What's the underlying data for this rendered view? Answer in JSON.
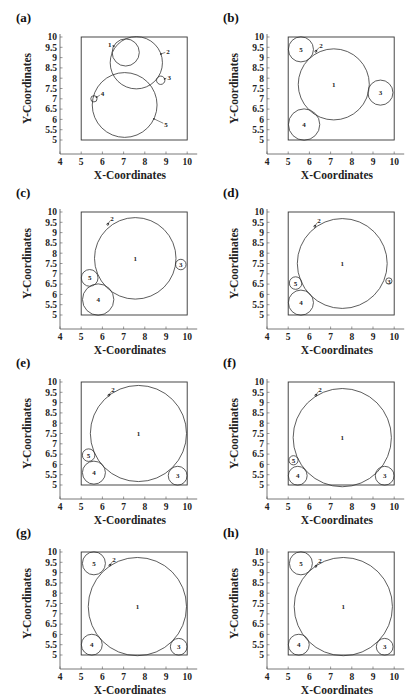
{
  "figure": {
    "xlabel": "X-Coordinates",
    "ylabel": "Y-Coordinates",
    "x_ticks": [
      "4",
      "5",
      "6",
      "7",
      "8",
      "9",
      "10"
    ],
    "y_ticks": [
      "5",
      "5.5",
      "6",
      "6.5",
      "7",
      "7.5",
      "8",
      "8.5",
      "9",
      "9.5",
      "10"
    ]
  },
  "chart_data": [
    {
      "panel": "(a)",
      "type": "scatter",
      "title": "",
      "xlabel": "X-Coordinates",
      "ylabel": "Y-Coordinates",
      "xlim": [
        4,
        10
      ],
      "ylim": [
        5,
        10
      ],
      "container": {
        "x": [
          5,
          10
        ],
        "y": [
          5,
          10
        ]
      },
      "circles": [
        {
          "id": "1",
          "cx": 7.1,
          "cy": 9.25,
          "r": 0.65,
          "label_style": "arrow",
          "lx": 6.35,
          "ly": 9.65
        },
        {
          "id": "2",
          "cx": 7.6,
          "cy": 8.75,
          "r": 1.25,
          "label_style": "arrow",
          "lx": 9.1,
          "ly": 9.3
        },
        {
          "id": "3",
          "cx": 8.75,
          "cy": 7.9,
          "r": 0.2,
          "label_style": "arrow",
          "lx": 9.15,
          "ly": 8.05
        },
        {
          "id": "4",
          "cx": 5.6,
          "cy": 7.0,
          "r": 0.15,
          "label_style": "arrow",
          "lx": 6.0,
          "ly": 7.25
        },
        {
          "id": "5",
          "cx": 7.05,
          "cy": 6.7,
          "r": 1.55,
          "label_style": "arrow",
          "lx": 9.0,
          "ly": 5.75
        }
      ]
    },
    {
      "panel": "(b)",
      "type": "scatter",
      "title": "",
      "xlabel": "X-Coordinates",
      "ylabel": "Y-Coordinates",
      "xlim": [
        4,
        10
      ],
      "ylim": [
        5,
        10
      ],
      "container": {
        "x": [
          5,
          10
        ],
        "y": [
          5,
          10
        ]
      },
      "circles": [
        {
          "id": "1",
          "cx": 7.15,
          "cy": 7.7,
          "r": 1.7,
          "label_style": "center"
        },
        {
          "id": "2",
          "cx": 6.3,
          "cy": 9.3,
          "r": 0.04,
          "label_style": "arrow",
          "lx": 6.55,
          "ly": 9.6
        },
        {
          "id": "3",
          "cx": 9.35,
          "cy": 7.3,
          "r": 0.6,
          "label_style": "center"
        },
        {
          "id": "4",
          "cx": 5.75,
          "cy": 5.75,
          "r": 0.75,
          "label_style": "center"
        },
        {
          "id": "5",
          "cx": 5.6,
          "cy": 9.4,
          "r": 0.6,
          "label_style": "center"
        }
      ]
    },
    {
      "panel": "(c)",
      "type": "scatter",
      "title": "",
      "xlabel": "X-Coordinates",
      "ylabel": "Y-Coordinates",
      "xlim": [
        4,
        10
      ],
      "ylim": [
        5,
        10
      ],
      "container": {
        "x": [
          5,
          10
        ],
        "y": [
          5,
          10
        ]
      },
      "circles": [
        {
          "id": "1",
          "cx": 7.55,
          "cy": 7.75,
          "r": 1.95,
          "label_style": "center"
        },
        {
          "id": "2",
          "cx": 6.25,
          "cy": 9.4,
          "r": 0.04,
          "label_style": "arrow",
          "lx": 6.45,
          "ly": 9.7
        },
        {
          "id": "3",
          "cx": 9.7,
          "cy": 7.45,
          "r": 0.25,
          "label_style": "center"
        },
        {
          "id": "4",
          "cx": 5.8,
          "cy": 5.75,
          "r": 0.75,
          "label_style": "center"
        },
        {
          "id": "5",
          "cx": 5.4,
          "cy": 6.8,
          "r": 0.4,
          "label_style": "center"
        }
      ]
    },
    {
      "panel": "(d)",
      "type": "scatter",
      "title": "",
      "xlabel": "X-Coordinates",
      "ylabel": "Y-Coordinates",
      "xlim": [
        4,
        10
      ],
      "ylim": [
        5,
        10
      ],
      "container": {
        "x": [
          5,
          10
        ],
        "y": [
          5,
          10
        ]
      },
      "circles": [
        {
          "id": "1",
          "cx": 7.55,
          "cy": 7.5,
          "r": 2.15,
          "label_style": "center"
        },
        {
          "id": "2",
          "cx": 6.25,
          "cy": 9.3,
          "r": 0.04,
          "label_style": "arrow",
          "lx": 6.45,
          "ly": 9.6
        },
        {
          "id": "3",
          "cx": 9.75,
          "cy": 6.65,
          "r": 0.15,
          "label_style": "center"
        },
        {
          "id": "4",
          "cx": 5.6,
          "cy": 5.6,
          "r": 0.6,
          "label_style": "center"
        },
        {
          "id": "5",
          "cx": 5.35,
          "cy": 6.55,
          "r": 0.3,
          "label_style": "center"
        }
      ]
    },
    {
      "panel": "(e)",
      "type": "scatter",
      "title": "",
      "xlabel": "X-Coordinates",
      "ylabel": "Y-Coordinates",
      "xlim": [
        4,
        10
      ],
      "ylim": [
        5,
        10
      ],
      "container": {
        "x": [
          5,
          10
        ],
        "y": [
          5,
          10
        ]
      },
      "circles": [
        {
          "id": "1",
          "cx": 7.7,
          "cy": 7.5,
          "r": 2.3,
          "label_style": "center"
        },
        {
          "id": "2",
          "cx": 6.3,
          "cy": 9.35,
          "r": 0.04,
          "label_style": "arrow",
          "lx": 6.5,
          "ly": 9.65
        },
        {
          "id": "3",
          "cx": 9.55,
          "cy": 5.45,
          "r": 0.45,
          "label_style": "center"
        },
        {
          "id": "4",
          "cx": 5.6,
          "cy": 5.6,
          "r": 0.55,
          "label_style": "center"
        },
        {
          "id": "5",
          "cx": 5.35,
          "cy": 6.45,
          "r": 0.3,
          "label_style": "center"
        }
      ]
    },
    {
      "panel": "(f)",
      "type": "scatter",
      "title": "",
      "xlabel": "X-Coordinates",
      "ylabel": "Y-Coordinates",
      "xlim": [
        4,
        10
      ],
      "ylim": [
        5,
        10
      ],
      "container": {
        "x": [
          5,
          10
        ],
        "y": [
          5,
          10
        ]
      },
      "circles": [
        {
          "id": "1",
          "cx": 7.55,
          "cy": 7.3,
          "r": 2.35,
          "label_style": "center"
        },
        {
          "id": "2",
          "cx": 6.3,
          "cy": 9.35,
          "r": 0.04,
          "label_style": "arrow",
          "lx": 6.5,
          "ly": 9.65
        },
        {
          "id": "3",
          "cx": 9.55,
          "cy": 5.45,
          "r": 0.45,
          "label_style": "center"
        },
        {
          "id": "4",
          "cx": 5.45,
          "cy": 5.45,
          "r": 0.45,
          "label_style": "center"
        },
        {
          "id": "5",
          "cx": 5.25,
          "cy": 6.2,
          "r": 0.22,
          "label_style": "center"
        }
      ]
    },
    {
      "panel": "(g)",
      "type": "scatter",
      "title": "",
      "xlabel": "X-Coordinates",
      "ylabel": "Y-Coordinates",
      "xlim": [
        4,
        10
      ],
      "ylim": [
        5,
        10
      ],
      "container": {
        "x": [
          5,
          10
        ],
        "y": [
          5,
          10
        ]
      },
      "circles": [
        {
          "id": "1",
          "cx": 7.65,
          "cy": 7.35,
          "r": 2.35,
          "label_style": "center"
        },
        {
          "id": "2",
          "cx": 6.35,
          "cy": 9.35,
          "r": 0.04,
          "label_style": "arrow",
          "lx": 6.55,
          "ly": 9.65
        },
        {
          "id": "3",
          "cx": 9.6,
          "cy": 5.4,
          "r": 0.4,
          "label_style": "center"
        },
        {
          "id": "4",
          "cx": 5.5,
          "cy": 5.5,
          "r": 0.5,
          "label_style": "center"
        },
        {
          "id": "5",
          "cx": 5.6,
          "cy": 9.45,
          "r": 0.55,
          "label_style": "center"
        }
      ]
    },
    {
      "panel": "(h)",
      "type": "scatter",
      "title": "",
      "xlabel": "X-Coordinates",
      "ylabel": "Y-Coordinates",
      "xlim": [
        4,
        10
      ],
      "ylim": [
        5,
        10
      ],
      "container": {
        "x": [
          5,
          10
        ],
        "y": [
          5,
          10
        ]
      },
      "circles": [
        {
          "id": "1",
          "cx": 7.6,
          "cy": 7.35,
          "r": 2.35,
          "label_style": "center"
        },
        {
          "id": "2",
          "cx": 6.3,
          "cy": 9.3,
          "r": 0.04,
          "label_style": "arrow",
          "lx": 6.5,
          "ly": 9.6
        },
        {
          "id": "3",
          "cx": 9.55,
          "cy": 5.4,
          "r": 0.4,
          "label_style": "center"
        },
        {
          "id": "4",
          "cx": 5.5,
          "cy": 5.5,
          "r": 0.5,
          "label_style": "center"
        },
        {
          "id": "5",
          "cx": 5.6,
          "cy": 9.45,
          "r": 0.55,
          "label_style": "center"
        }
      ]
    }
  ],
  "layout": {
    "panels": [
      {
        "left": 0,
        "top": 0
      },
      {
        "left": 207,
        "top": 0
      },
      {
        "left": 0,
        "top": 175
      },
      {
        "left": 207,
        "top": 175
      },
      {
        "left": 0,
        "top": 345
      },
      {
        "left": 207,
        "top": 345
      },
      {
        "left": 0,
        "top": 515
      },
      {
        "left": 207,
        "top": 515
      }
    ],
    "colors": {
      "line": "#333333",
      "axis": "#555555",
      "text": "#222222"
    }
  }
}
